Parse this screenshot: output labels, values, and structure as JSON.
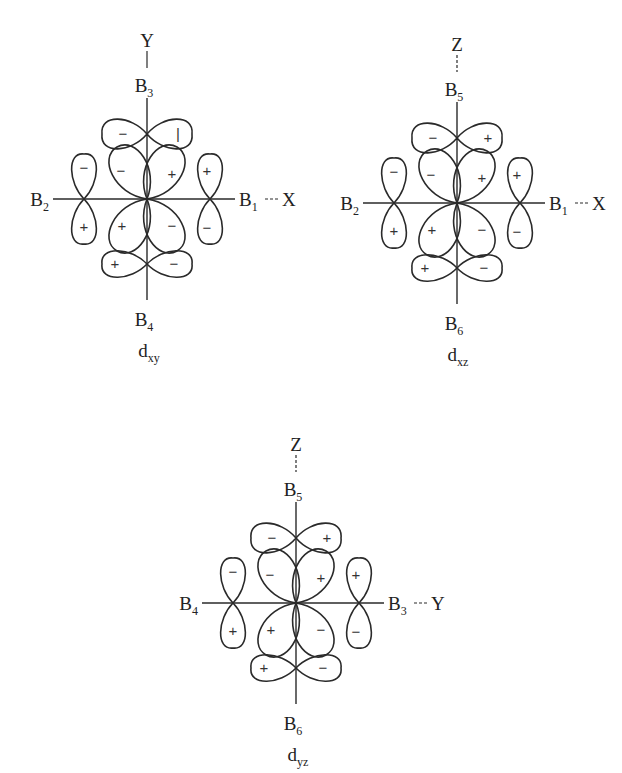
{
  "diagrams": [
    {
      "id": "dxy",
      "caption": {
        "main": "d",
        "sub": "xy"
      },
      "center": [
        147,
        199
      ],
      "axis_labels": {
        "top": "Y",
        "right": "X"
      },
      "top_connector": "solid",
      "ligands": {
        "top": {
          "main": "B",
          "sub": "3"
        },
        "bottom": {
          "main": "B",
          "sub": "4"
        },
        "left": {
          "main": "B",
          "sub": "2"
        },
        "right": {
          "main": "B",
          "sub": "1"
        }
      },
      "signs": {
        "top_lobe": [
          "−",
          "+"
        ],
        "bottom_lobe": [
          "+",
          "−"
        ],
        "left_lobe": [
          "−",
          "+"
        ],
        "right_lobe": [
          "+",
          "−"
        ],
        "center": {
          "upper_left": "−",
          "upper_right": "+",
          "lower_left": "+",
          "lower_right": "−"
        }
      },
      "top_lobe_right_sign_rendered": "|"
    },
    {
      "id": "dxz",
      "caption": {
        "main": "d",
        "sub": "xz"
      },
      "center": [
        457,
        203
      ],
      "axis_labels": {
        "top": "Z",
        "right": "X"
      },
      "top_connector": "dashed",
      "ligands": {
        "top": {
          "main": "B",
          "sub": "5"
        },
        "bottom": {
          "main": "B",
          "sub": "6"
        },
        "left": {
          "main": "B",
          "sub": "2"
        },
        "right": {
          "main": "B",
          "sub": "1"
        }
      },
      "signs": {
        "top_lobe": [
          "−",
          "+"
        ],
        "bottom_lobe": [
          "+",
          "−"
        ],
        "left_lobe": [
          "−",
          "+"
        ],
        "right_lobe": [
          "+",
          "−"
        ],
        "center": {
          "upper_left": "−",
          "upper_right": "+",
          "lower_left": "+",
          "lower_right": "−"
        }
      }
    },
    {
      "id": "dyz",
      "caption": {
        "main": "d",
        "sub": "yz"
      },
      "center": [
        296,
        603
      ],
      "axis_labels": {
        "top": "Z",
        "right": "Y"
      },
      "top_connector": "dashed",
      "ligands": {
        "top": {
          "main": "B",
          "sub": "5"
        },
        "bottom": {
          "main": "B",
          "sub": "6"
        },
        "left": {
          "main": "B",
          "sub": "4"
        },
        "right": {
          "main": "B",
          "sub": "3"
        }
      },
      "signs": {
        "top_lobe": [
          "−",
          "+"
        ],
        "bottom_lobe": [
          "+",
          "−"
        ],
        "left_lobe": [
          "−",
          "+"
        ],
        "right_lobe": [
          "+",
          "−"
        ],
        "center": {
          "upper_left": "−",
          "upper_right": "+",
          "lower_left": "+",
          "lower_right": "−"
        }
      }
    }
  ],
  "colors": {
    "stroke": "#2a2a2a",
    "background": "#ffffff"
  }
}
